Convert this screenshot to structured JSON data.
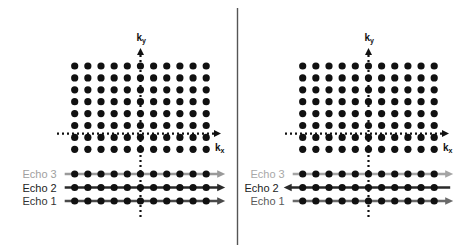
{
  "divider": {
    "x": 237.5,
    "y1": 8,
    "y2": 245,
    "color": "#555555"
  },
  "grid": {
    "cols": 11,
    "rows": 8,
    "dot_radius": 3.6,
    "row_spacing": 11.9,
    "col_spacing": 13.15,
    "first_row_y": 66,
    "dot_color": "#111111"
  },
  "panels": [
    {
      "id": "left",
      "first_col_x": 74.7,
      "axis_x": 140.5,
      "kx_axis_y": 133.6,
      "hdots_start_x": 57,
      "hdots_end_x": 221,
      "vdots_start_y": 48,
      "vdots_end_y": 219,
      "ky_label": {
        "main": "k",
        "sub": "y"
      },
      "kx_label": {
        "main": "k",
        "sub": "x"
      },
      "echoes": [
        {
          "label": "Echo 3",
          "y": 174,
          "color": "#9a9a9a",
          "text_color": "#a0a0a0",
          "direction": "right"
        },
        {
          "label": "Echo 2",
          "y": 187.5,
          "color": "#2a2a2a",
          "text_color": "#222222",
          "direction": "right"
        },
        {
          "label": "Echo 1",
          "y": 201,
          "color": "#4a4a4a",
          "text_color": "#333333",
          "direction": "right"
        }
      ]
    },
    {
      "id": "right",
      "first_col_x": 302.7,
      "axis_x": 368.5,
      "kx_axis_y": 133.6,
      "hdots_start_x": 285,
      "hdots_end_x": 449,
      "vdots_start_y": 48,
      "vdots_end_y": 219,
      "ky_label": {
        "main": "k",
        "sub": "y"
      },
      "kx_label": {
        "main": "k",
        "sub": "x"
      },
      "echoes": [
        {
          "label": "Echo 3",
          "y": 174,
          "color": "#a5a5a5",
          "text_color": "#a8a8a8",
          "direction": "right"
        },
        {
          "label": "Echo 2",
          "y": 187.5,
          "color": "#2a2a2a",
          "text_color": "#222222",
          "direction": "left"
        },
        {
          "label": "Echo 1",
          "y": 201,
          "color": "#6a6a6a",
          "text_color": "#5a5a5a",
          "direction": "right"
        }
      ]
    }
  ]
}
